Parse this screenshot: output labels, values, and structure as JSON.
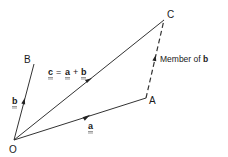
{
  "diagram": {
    "points": {
      "O": {
        "label": "O",
        "x": 14,
        "y": 140
      },
      "A": {
        "label": "A",
        "x": 146,
        "y": 98
      },
      "B": {
        "label": "B",
        "x": 34,
        "y": 64
      },
      "C": {
        "label": "C",
        "x": 164,
        "y": 20
      }
    },
    "vectors": [
      {
        "id": "a",
        "label": "a",
        "from": "O",
        "to": "A",
        "style": "solid"
      },
      {
        "id": "b",
        "label": "b",
        "from": "O",
        "to": "B",
        "style": "solid"
      },
      {
        "id": "c",
        "label": "c",
        "from": "O",
        "to": "C",
        "style": "solid"
      },
      {
        "id": "AC",
        "label": "Member of b",
        "from": "A",
        "to": "C",
        "style": "dashed"
      }
    ],
    "equation": {
      "lhs": "c",
      "eq": "=",
      "t1": "a",
      "plus": "+",
      "t2": "b"
    },
    "annotation": {
      "prefix": "Member of ",
      "vector": "b"
    },
    "colors": {
      "line": "#333333",
      "text": "#1a1a1a",
      "background": "#ffffff"
    }
  }
}
